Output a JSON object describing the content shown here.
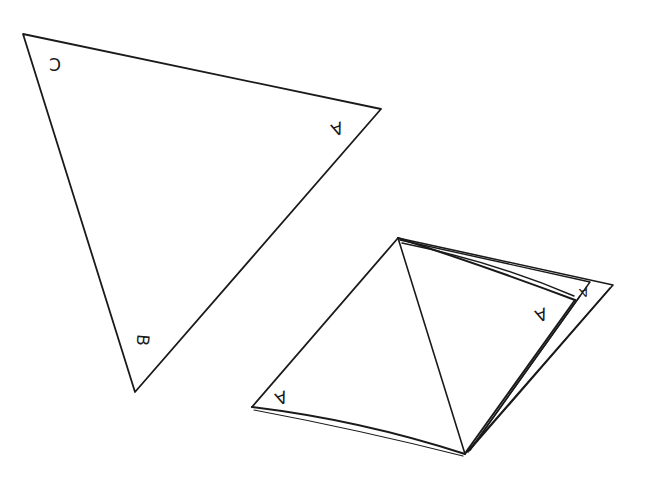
{
  "diagram": {
    "stroke_color": "#1a1a1a",
    "background": "#ffffff",
    "flat_triangle": {
      "vertices": {
        "C": [
          23,
          34
        ],
        "A": [
          381,
          109
        ],
        "B": [
          135,
          392
        ]
      },
      "labels": [
        {
          "text": "C",
          "x": 55,
          "y": 63,
          "rotate": 180
        },
        {
          "text": "A",
          "x": 337,
          "y": 128,
          "rotate": 160
        },
        {
          "text": "B",
          "x": 142,
          "y": 340,
          "rotate": 95
        }
      ]
    },
    "folded_piece": {
      "vertices": {
        "top": [
          398,
          238
        ],
        "left": [
          252,
          407
        ],
        "bottom": [
          465,
          454
        ],
        "right": [
          613,
          285
        ],
        "flap_corner": [
          575,
          300
        ]
      },
      "labels": [
        {
          "text": "A",
          "x": 280,
          "y": 398,
          "rotate": 160
        },
        {
          "text": "A",
          "x": 540,
          "y": 315,
          "rotate": 160
        },
        {
          "text": "A",
          "x": 583,
          "y": 290,
          "rotate": 160
        }
      ]
    }
  }
}
